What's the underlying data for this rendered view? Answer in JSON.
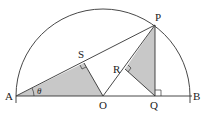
{
  "diagram": {
    "type": "geometry-semicircle",
    "points": {
      "A": {
        "label": "A",
        "x": 16,
        "y": 96
      },
      "B": {
        "label": "B",
        "x": 192,
        "y": 96
      },
      "O": {
        "label": "O",
        "x": 103,
        "y": 96
      },
      "P": {
        "label": "P",
        "x": 155,
        "y": 25
      },
      "Q": {
        "label": "Q",
        "x": 155,
        "y": 96
      },
      "S": {
        "label": "S",
        "x": 84,
        "y": 63
      },
      "R": {
        "label": "R",
        "x": 125,
        "y": 69
      }
    },
    "angle_label": "θ",
    "colors": {
      "stroke": "#333333",
      "shade": "#c8c8c8",
      "label": "#222222"
    },
    "shaded_triangles": [
      "ASO",
      "PRQ"
    ],
    "right_angles": [
      "S",
      "R",
      "Q"
    ]
  }
}
